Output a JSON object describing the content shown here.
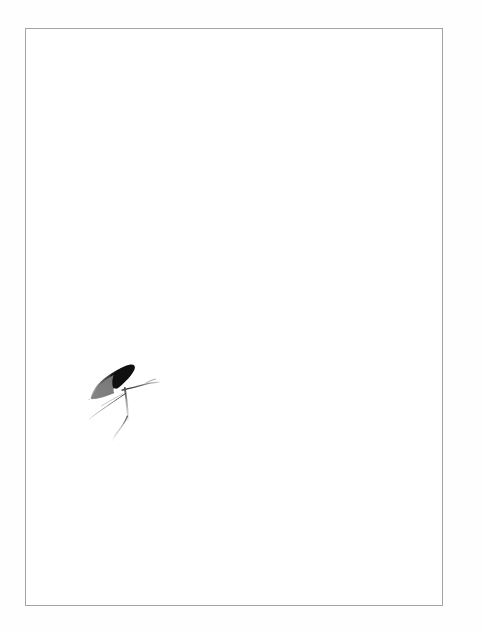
{
  "page": {
    "width": 482,
    "height": 632,
    "background_color": "#ffffff",
    "margin_color": "#fefefe"
  },
  "plate": {
    "frame_color": "#a4a4a4",
    "frame_left": 25,
    "frame_top": 28,
    "frame_width": 418,
    "frame_height": 578,
    "fill_color": "#ffffff"
  },
  "artwork": {
    "name": "ink-brush-figure",
    "description": "small monochrome brush-and-ink mark resembling a bird or insect form",
    "bbox_left": 88,
    "bbox_top": 343,
    "bbox_width": 74,
    "bbox_height": 94,
    "ink_color_dark": "#111111",
    "ink_color_mid": "#6b6b6b",
    "ink_color_light": "#b9b9b9",
    "ink_color_faint": "#d8d8d8",
    "strokes": [
      {
        "name": "body-wedge-dark",
        "tone": "#141414",
        "note": "solid black wedge forming the upper-right mass of the body"
      },
      {
        "name": "body-wedge-mid",
        "tone": "#6e6e6e",
        "note": "grey tapering tail of the wedge running down to the lower left"
      },
      {
        "name": "antenna-right",
        "tone": "#2b2b2b",
        "note": "thin hairline sweeping right and slightly up from the body"
      },
      {
        "name": "leg-lower-left",
        "tone": "#8a8a8a",
        "note": "thin hairline descending to the lower left"
      },
      {
        "name": "leg-vertical",
        "tone": "#3a3a3a",
        "note": "short vertical stroke beneath the body"
      },
      {
        "name": "tail-curve",
        "tone": "#cfcfcf",
        "note": "faint curving trail descending and fading out"
      }
    ]
  },
  "caption": {
    "text": ""
  }
}
